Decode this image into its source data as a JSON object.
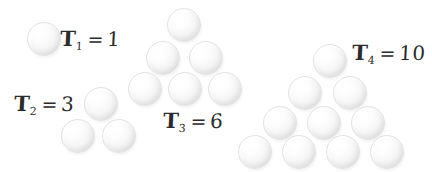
{
  "figure": {
    "background_color": "#ffffff",
    "ball_color": "#f2f2f2",
    "ink_color": "#2b2b2b",
    "ball_diameter": 34
  },
  "groups": [
    {
      "id": "t1",
      "symbol": "T",
      "subscript": "1",
      "equals": "=",
      "value": "1",
      "label_text": "T1 = 1",
      "count": 1,
      "rows": [
        1
      ],
      "label": {
        "x": 60,
        "y": 26
      },
      "balls": [
        {
          "x": 27,
          "y": 22
        }
      ]
    },
    {
      "id": "t2",
      "symbol": "T",
      "subscript": "2",
      "equals": "=",
      "value": "3",
      "label_text": "T2 = 3",
      "count": 3,
      "rows": [
        1,
        2
      ],
      "label": {
        "x": 14,
        "y": 91
      },
      "balls": [
        {
          "x": 84,
          "y": 87
        },
        {
          "x": 61,
          "y": 119
        },
        {
          "x": 102,
          "y": 119
        }
      ]
    },
    {
      "id": "t3",
      "symbol": "T",
      "subscript": "3",
      "equals": "=",
      "value": "6",
      "label_text": "T3 = 6",
      "count": 6,
      "rows": [
        1,
        2,
        3
      ],
      "label": {
        "x": 163,
        "y": 108
      },
      "balls": [
        {
          "x": 167,
          "y": 8
        },
        {
          "x": 146,
          "y": 41
        },
        {
          "x": 189,
          "y": 41
        },
        {
          "x": 128,
          "y": 72
        },
        {
          "x": 168,
          "y": 72
        },
        {
          "x": 208,
          "y": 72
        }
      ]
    },
    {
      "id": "t4",
      "symbol": "T",
      "subscript": "4",
      "equals": "=",
      "value": "10",
      "label_text": "T4 = 10",
      "count": 10,
      "rows": [
        1,
        2,
        3,
        4
      ],
      "label": {
        "x": 352,
        "y": 40
      },
      "balls": [
        {
          "x": 313,
          "y": 44
        },
        {
          "x": 288,
          "y": 76
        },
        {
          "x": 333,
          "y": 76
        },
        {
          "x": 263,
          "y": 106
        },
        {
          "x": 307,
          "y": 106
        },
        {
          "x": 351,
          "y": 106
        },
        {
          "x": 238,
          "y": 135
        },
        {
          "x": 282,
          "y": 135
        },
        {
          "x": 326,
          "y": 135
        },
        {
          "x": 370,
          "y": 135
        }
      ]
    }
  ]
}
